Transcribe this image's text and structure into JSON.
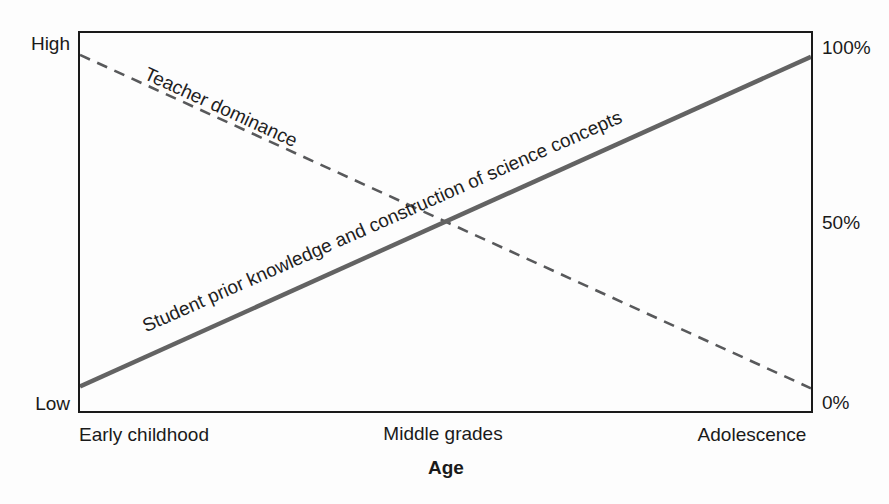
{
  "figure": {
    "background": "#fdfdfd",
    "frame_color": "#1a1a1a",
    "text_color": "#1a1a1a"
  },
  "chart_data": {
    "type": "line",
    "title": "",
    "x_axis": {
      "label": "Age",
      "categories": [
        "Early childhood",
        "Middle grades",
        "Adolescence"
      ]
    },
    "y_axis_left": {
      "labels": [
        "High",
        "Low"
      ],
      "scale": "qualitative"
    },
    "y_axis_right": {
      "labels": [
        "100%",
        "50%",
        "0%"
      ],
      "range": [
        0,
        100
      ]
    },
    "grid": false,
    "legend": "rotated labels along lines",
    "series": [
      {
        "name": "Teacher dominance",
        "style": "dashed",
        "color": "#58595b",
        "stroke_width": 2.6,
        "x_percent": [
          0,
          100
        ],
        "y_percent": [
          94.2,
          6
        ]
      },
      {
        "name": "Student prior knowledge and construction of science concepts",
        "style": "solid",
        "color": "#636363",
        "stroke_width": 4.5,
        "x_percent": [
          0,
          100
        ],
        "y_percent": [
          6.5,
          93.7
        ]
      }
    ]
  }
}
